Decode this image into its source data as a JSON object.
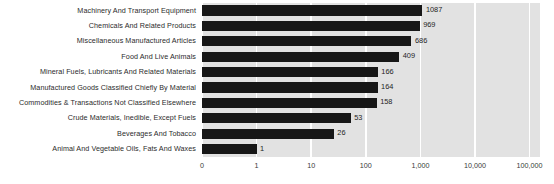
{
  "chart_data": {
    "type": "bar",
    "orientation": "horizontal",
    "title": "",
    "subtitle": "",
    "xlabel": "",
    "ylabel": "",
    "xscale": "log",
    "grid": true,
    "legend": null,
    "legend_position": "none",
    "xlim": [
      0,
      100000
    ],
    "xticks": [
      0,
      1,
      10,
      100,
      1000,
      10000,
      100000
    ],
    "xtick_labels": [
      "0",
      "1",
      "10",
      "100",
      "1,000",
      "10,000",
      "100,000"
    ],
    "categories": [
      "Machinery And Transport Equipment",
      "Chemicals And Related Products",
      "Miscellaneous Manufactured Articles",
      "Food And Live Animals",
      "Mineral Fuels, Lubricants And Related Materials",
      "Manufactured Goods Classified Chiefly By Material",
      "Commodities & Transactions Not Classified Elsewhere",
      "Crude Materials, Inedible, Except Fuels",
      "Beverages And Tobacco",
      "Animal And Vegetable Oils, Fats And Waxes"
    ],
    "values": [
      1087,
      969,
      686,
      409,
      166,
      164,
      158,
      53,
      26,
      1
    ],
    "value_labels": [
      "1087",
      "969",
      "686",
      "409",
      "166",
      "164",
      "158",
      "53",
      "26",
      "1"
    ],
    "colors": {
      "bar": "#171717",
      "plot_background": "#e2e2e2",
      "figure_background": "#ffffff",
      "gridline": "#ffffff",
      "label_text": "#2b2b2b",
      "value_text": "#1e1e1e",
      "tick_text": "#3a3a3a"
    }
  }
}
